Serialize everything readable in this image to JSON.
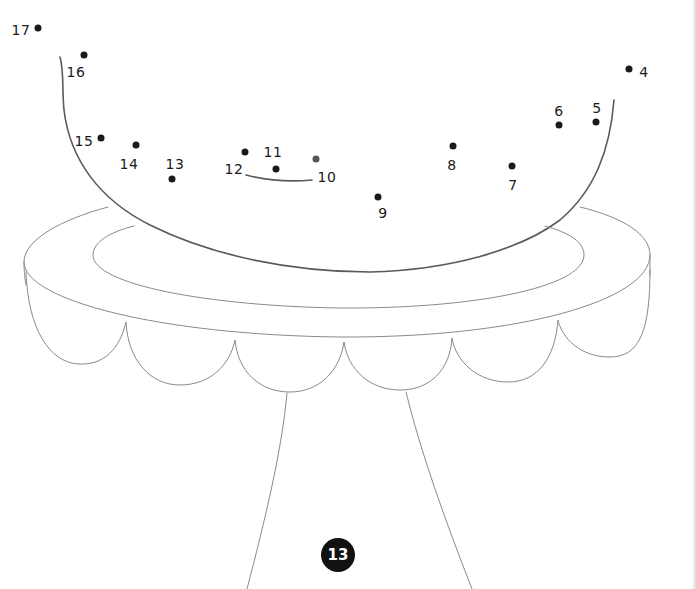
{
  "page": {
    "page_number": "13"
  },
  "dots": [
    {
      "label": "4",
      "x": 629,
      "y": 69,
      "label_x": 644,
      "label_y": 72
    },
    {
      "label": "5",
      "x": 596,
      "y": 122,
      "label_x": 597,
      "label_y": 108
    },
    {
      "label": "6",
      "x": 559,
      "y": 125,
      "label_x": 559,
      "label_y": 111
    },
    {
      "label": "7",
      "x": 512,
      "y": 166,
      "label_x": 513,
      "label_y": 185
    },
    {
      "label": "8",
      "x": 453,
      "y": 146,
      "label_x": 452,
      "label_y": 165
    },
    {
      "label": "9",
      "x": 378,
      "y": 197,
      "label_x": 383,
      "label_y": 213
    },
    {
      "label": "10",
      "x": 316,
      "y": 159,
      "label_x": 327,
      "label_y": 177
    },
    {
      "label": "11",
      "x": 276,
      "y": 169,
      "label_x": 273,
      "label_y": 152
    },
    {
      "label": "12",
      "x": 245,
      "y": 152,
      "label_x": 234,
      "label_y": 169
    },
    {
      "label": "13",
      "x": 172,
      "y": 179,
      "label_x": 175,
      "label_y": 164
    },
    {
      "label": "14",
      "x": 136,
      "y": 145,
      "label_x": 129,
      "label_y": 164
    },
    {
      "label": "15",
      "x": 101,
      "y": 138,
      "label_x": 84,
      "label_y": 141
    },
    {
      "label": "16",
      "x": 84,
      "y": 55,
      "label_x": 76,
      "label_y": 72
    },
    {
      "label": "17",
      "x": 38,
      "y": 28,
      "label_x": 21,
      "label_y": 30
    }
  ],
  "colors": {
    "dot": "#1a1a1a",
    "line": "#8a8a8a",
    "badge_bg": "#111111",
    "badge_text": "#ffffff"
  }
}
